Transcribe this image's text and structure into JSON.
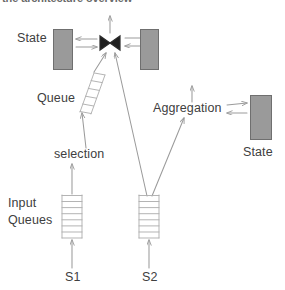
{
  "diagram": {
    "title_clipped": "the architecture overview",
    "type": "stream-processing-dataflow-diagram",
    "labels": {
      "state_left": "State",
      "state_right_bottom": "State",
      "queue": "Queue",
      "aggregation": "Aggregation",
      "selection": "selection",
      "input_queues": "Input\nQueues",
      "input_queues_line1": "Input",
      "input_queues_line2": "Queues",
      "source_1": "S1",
      "source_2": "S2",
      "join_operator": "join-bowtie"
    },
    "colors": {
      "state_fill": "#9a9a9a",
      "state_stroke": "#6f6f6f",
      "line": "#9b9b9b",
      "text": "#404040",
      "background": "#ffffff"
    },
    "nodes": [
      {
        "id": "state-left",
        "kind": "state-store",
        "label": "State",
        "x": 53,
        "y": 29,
        "w": 20,
        "h": 41
      },
      {
        "id": "join",
        "kind": "join-operator",
        "label": "join-bowtie",
        "x": 99,
        "y": 35,
        "w": 22,
        "h": 15
      },
      {
        "id": "state-right",
        "kind": "state-store",
        "label": "",
        "x": 140,
        "y": 29,
        "w": 19,
        "h": 41
      },
      {
        "id": "queue",
        "kind": "slanted-queue-ladder",
        "label": "Queue",
        "rungs": 5
      },
      {
        "id": "aggregation",
        "kind": "operator",
        "label": "Aggregation"
      },
      {
        "id": "state-agg",
        "kind": "state-store",
        "label": "State",
        "x": 250,
        "y": 95,
        "w": 22,
        "h": 45
      },
      {
        "id": "selection",
        "kind": "operator",
        "label": "selection"
      },
      {
        "id": "input-queue-s1",
        "kind": "vertical-queue-ladder",
        "rungs": 7
      },
      {
        "id": "input-queue-s2",
        "kind": "vertical-queue-ladder",
        "rungs": 7
      },
      {
        "id": "source-s1",
        "kind": "stream-source",
        "label": "S1"
      },
      {
        "id": "source-s2",
        "kind": "stream-source",
        "label": "S2"
      }
    ],
    "edges": [
      {
        "from": "state-left",
        "to": "join",
        "direction": "bidirectional"
      },
      {
        "from": "state-right",
        "to": "join",
        "direction": "bidirectional"
      },
      {
        "from": "join",
        "to": "output",
        "direction": "up"
      },
      {
        "from": "queue",
        "to": "join",
        "direction": "up"
      },
      {
        "from": "input-queue-s2",
        "to": "join",
        "direction": "up"
      },
      {
        "from": "selection",
        "to": "queue",
        "direction": "up"
      },
      {
        "from": "input-queue-s1",
        "to": "selection",
        "direction": "up"
      },
      {
        "from": "source-s1",
        "to": "input-queue-s1",
        "direction": "up"
      },
      {
        "from": "source-s2",
        "to": "input-queue-s2",
        "direction": "up"
      },
      {
        "from": "input-queue-s2",
        "to": "aggregation",
        "direction": "up"
      },
      {
        "from": "aggregation",
        "to": "state-agg",
        "direction": "bidirectional"
      },
      {
        "from": "aggregation",
        "to": "output",
        "direction": "up"
      }
    ]
  }
}
